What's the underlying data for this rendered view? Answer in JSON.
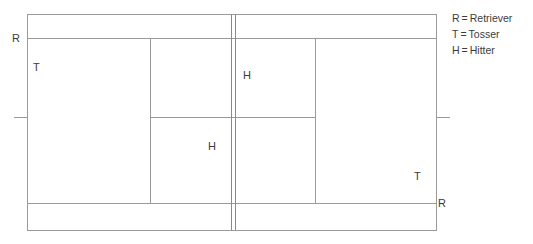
{
  "diagram": {
    "type": "tennis-court-drill-diagram",
    "colors": {
      "line": "#9a9a9a",
      "line_dark": "#8a8a8a",
      "text": "#3c3c3c",
      "background": "#ffffff"
    },
    "court_lines": {
      "outer_baseline_left_x": 27,
      "outer_baseline_right_x": 437,
      "outer_top_y": 14,
      "outer_bottom_y": 230,
      "singles_sideline_top_y": 38,
      "singles_sideline_bottom_y": 203,
      "service_line_left_x": 150,
      "service_line_right_x": 316,
      "center_service_line_y": 117,
      "net_x1": 231,
      "net_x2": 235,
      "center_mark_left_x1": 14,
      "center_mark_left_x2": 27,
      "center_mark_right_x1": 437,
      "center_mark_right_x2": 450
    },
    "player_labels": [
      {
        "id": "retriever-top-left",
        "text": "R",
        "x": 12,
        "y": 33
      },
      {
        "id": "tosser-top-left",
        "text": "T",
        "x": 33,
        "y": 62
      },
      {
        "id": "hitter-upper",
        "text": "H",
        "x": 243,
        "y": 70
      },
      {
        "id": "hitter-lower",
        "text": "H",
        "x": 208,
        "y": 141
      },
      {
        "id": "tosser-bottom-right",
        "text": "T",
        "x": 414,
        "y": 171
      },
      {
        "id": "retriever-bottom-right",
        "text": "R",
        "x": 438,
        "y": 198
      }
    ]
  },
  "legend": {
    "equals": "=",
    "entries": [
      {
        "key": "R",
        "value": "Retriever"
      },
      {
        "key": "T",
        "value": "Tosser"
      },
      {
        "key": "H",
        "value": "Hitter"
      }
    ]
  }
}
